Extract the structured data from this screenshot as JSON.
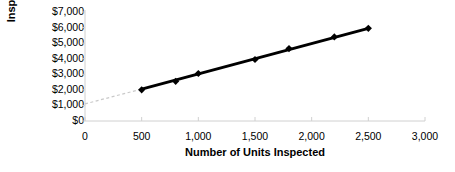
{
  "chart_data": {
    "type": "scatter",
    "title": "",
    "xlabel": "Number of Units Inspected",
    "ylabel": "Inspection Costs",
    "xlim": [
      0,
      3000
    ],
    "ylim": [
      0,
      7000
    ],
    "grid": false,
    "legend": "none",
    "x_tick_labels": [
      "0",
      "500",
      "1,000",
      "1,500",
      "2,000",
      "2,500",
      "3,000"
    ],
    "x_ticks": [
      0,
      500,
      1000,
      1500,
      2000,
      2500,
      3000
    ],
    "y_tick_labels": [
      "$7,000",
      "$6,000",
      "$5,000",
      "$4,000",
      "$3,000",
      "$2,000",
      "$1,000",
      "$0"
    ],
    "y_ticks": [
      7000,
      6000,
      5000,
      4000,
      3000,
      2000,
      1000,
      0
    ],
    "series": [
      {
        "name": "Inspection Costs",
        "marker": "diamond",
        "color": "#000000",
        "x": [
          500,
          800,
          1000,
          1500,
          1800,
          2200,
          2500
        ],
        "y": [
          2000,
          2550,
          3050,
          3950,
          4650,
          5400,
          5950
        ]
      }
    ],
    "trend_line": {
      "name": "Cost line",
      "color": "#000000",
      "width": 3,
      "x": [
        500,
        2500
      ],
      "y": [
        2050,
        5950
      ]
    },
    "extrapolation_line": {
      "name": "Fixed cost extension",
      "color": "#c9c9c9",
      "style": "dashed",
      "x": [
        0,
        500
      ],
      "y": [
        1100,
        2050
      ]
    },
    "axis_color": "#d0d0d0"
  }
}
